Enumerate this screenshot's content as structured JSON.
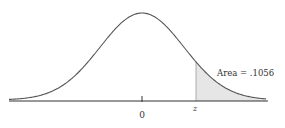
{
  "figure": {
    "type": "normal-distribution-curve",
    "center_label": "0",
    "z_label": "z",
    "area_label": "Area = .1056",
    "shaded_region": "right tail beyond z",
    "colors": {
      "curve": "#555555",
      "axis": "#333333",
      "shade": "#e6e6e6"
    }
  }
}
